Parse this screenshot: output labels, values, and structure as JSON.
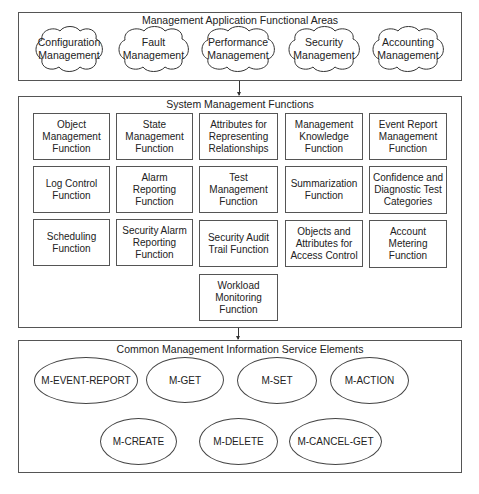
{
  "diagram": {
    "functional_areas": {
      "title": "Management Application Functional Areas",
      "items": [
        {
          "label": "Configuration\nManagement",
          "shape": "cloud"
        },
        {
          "label": "Fault\nManagement",
          "shape": "cloud"
        },
        {
          "label": "Performance\nManagement",
          "shape": "cloud"
        },
        {
          "label": "Security\nManagement",
          "shape": "cloud"
        },
        {
          "label": "Accounting\nManagement",
          "shape": "cloud"
        }
      ]
    },
    "system_functions": {
      "title": "System Management Functions",
      "items": [
        {
          "label": "Object\nManagement\nFunction"
        },
        {
          "label": "State\nManagement\nFunction"
        },
        {
          "label": "Attributes for\nRepresenting\nRelationships"
        },
        {
          "label": "Management\nKnowledge\nFunction"
        },
        {
          "label": "Event Report\nManagement\nFunction"
        },
        {
          "label": "Log Control\nFunction"
        },
        {
          "label": "Alarm Reporting\nFunction"
        },
        {
          "label": "Test\nManagement\nFunction"
        },
        {
          "label": "Summarization\nFunction"
        },
        {
          "label": "Confidence and\nDiagnostic Test\nCategories"
        },
        {
          "label": "Scheduling\nFunction"
        },
        {
          "label": "Security Alarm\nReporting\nFunction"
        },
        {
          "label": "Security Audit\nTrail Function"
        },
        {
          "label": "Objects and\nAttributes for\nAccess Control"
        },
        {
          "label": "Account\nMetering\nFunction"
        },
        {
          "label": "Workload\nMonitoring\nFunction"
        }
      ]
    },
    "service_elements": {
      "title": "Common Management Information Service Elements",
      "items": [
        {
          "label": "M-EVENT-REPORT"
        },
        {
          "label": "M-GET"
        },
        {
          "label": "M-SET"
        },
        {
          "label": "M-ACTION"
        },
        {
          "label": "M-CREATE"
        },
        {
          "label": "M-DELETE"
        },
        {
          "label": "M-CANCEL-GET"
        }
      ]
    },
    "connectors": [
      {
        "from": "functional_areas",
        "to": "system_functions",
        "type": "arrow"
      },
      {
        "from": "system_functions",
        "to": "service_elements",
        "type": "arrow"
      }
    ]
  }
}
